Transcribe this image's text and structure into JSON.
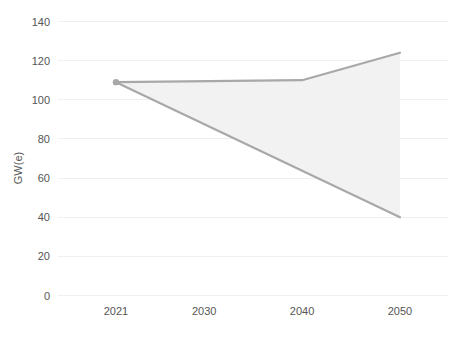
{
  "chart_data": {
    "type": "area",
    "title": "",
    "subtitle": "",
    "xlabel": "",
    "ylabel": "GW(e)",
    "x": [
      2021,
      2030,
      2040,
      2050
    ],
    "xtick_labels": [
      "2021",
      "2030",
      "2040",
      "2050"
    ],
    "ytick_labels": [
      "0",
      "20",
      "40",
      "60",
      "80",
      "100",
      "120",
      "140"
    ],
    "yticks": [
      0,
      20,
      40,
      60,
      80,
      100,
      120,
      140
    ],
    "ylim": [
      0,
      140
    ],
    "xlim": [
      2021,
      2050
    ],
    "grid": true,
    "grid_axis": "y",
    "legend": "none",
    "series": [
      {
        "name": "High case",
        "x": [
          2021,
          2040,
          2050
        ],
        "values": [
          109,
          110,
          124
        ]
      },
      {
        "name": "Low case",
        "x": [
          2021,
          2050
        ],
        "values": [
          109,
          40
        ]
      }
    ],
    "markers": [
      {
        "x": 2021,
        "value": 109
      }
    ],
    "colors": {
      "band_fill": "#f2f2f2",
      "line": "#a8a8a8",
      "gridline": "#f0f0f0",
      "text": "#555555",
      "background": "#ffffff"
    }
  }
}
